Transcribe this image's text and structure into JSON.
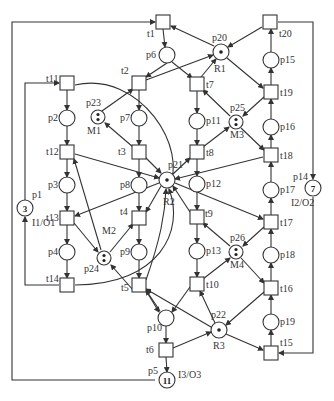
{
  "diagram": {
    "type": "petri-net",
    "colors": {
      "stroke": "#333333",
      "background": "#ffffff"
    },
    "places": [
      {
        "id": "p1",
        "x": 25,
        "y": 208,
        "tokens": "3",
        "label": "p1",
        "sublabel": "I1/O1"
      },
      {
        "id": "p2",
        "x": 67,
        "y": 118,
        "label": "p2"
      },
      {
        "id": "p3",
        "x": 67,
        "y": 185,
        "label": "p3"
      },
      {
        "id": "p4",
        "x": 67,
        "y": 252,
        "label": "p4"
      },
      {
        "id": "p5",
        "x": 167,
        "y": 380,
        "tokens": "11",
        "label": "p5",
        "sublabel": "I3/O3"
      },
      {
        "id": "p6",
        "x": 167,
        "y": 55,
        "label": "p6"
      },
      {
        "id": "p7",
        "x": 139,
        "y": 118,
        "label": "p7"
      },
      {
        "id": "p8",
        "x": 139,
        "y": 185,
        "label": "p8"
      },
      {
        "id": "p9",
        "x": 139,
        "y": 252,
        "label": "p9"
      },
      {
        "id": "p10",
        "x": 166,
        "y": 318,
        "label": "p10"
      },
      {
        "id": "p11",
        "x": 197,
        "y": 121,
        "label": "p11"
      },
      {
        "id": "p12",
        "x": 197,
        "y": 184,
        "label": "p12"
      },
      {
        "id": "p13",
        "x": 197,
        "y": 251,
        "label": "p13"
      },
      {
        "id": "p14",
        "x": 313,
        "y": 188,
        "tokens": "7",
        "label": "p14",
        "sublabel": "I2/O2"
      },
      {
        "id": "p15",
        "x": 271,
        "y": 60,
        "label": "p15"
      },
      {
        "id": "p16",
        "x": 271,
        "y": 127,
        "label": "p16"
      },
      {
        "id": "p17",
        "x": 271,
        "y": 190,
        "label": "p17"
      },
      {
        "id": "p18",
        "x": 271,
        "y": 255,
        "label": "p18"
      },
      {
        "id": "p19",
        "x": 271,
        "y": 322,
        "label": "p19"
      },
      {
        "id": "p20",
        "x": 221,
        "y": 52,
        "tokens": "dot",
        "label": "p20",
        "sublabel": "R1"
      },
      {
        "id": "p21",
        "x": 167,
        "y": 180,
        "tokens": "dot",
        "label": "p21",
        "sublabel": "R2"
      },
      {
        "id": "p22",
        "x": 219,
        "y": 330,
        "tokens": "dot",
        "label": "p22",
        "sublabel": "R3"
      },
      {
        "id": "p23",
        "x": 98,
        "y": 117,
        "tokens": "dots2",
        "label": "p23",
        "sublabel": "M1"
      },
      {
        "id": "p24",
        "x": 104,
        "y": 258,
        "tokens": "dots2",
        "label": "p24",
        "sublabel": "M2"
      },
      {
        "id": "p25",
        "x": 236,
        "y": 122,
        "tokens": "dots2",
        "label": "p25",
        "sublabel": "M3"
      },
      {
        "id": "p26",
        "x": 236,
        "y": 252,
        "tokens": "dots2",
        "label": "p26",
        "sublabel": "M4"
      }
    ],
    "transitions": [
      {
        "id": "t1",
        "x": 163,
        "y": 22,
        "label": "t1"
      },
      {
        "id": "t2",
        "x": 139,
        "y": 83,
        "label": "t2"
      },
      {
        "id": "t3",
        "x": 139,
        "y": 152,
        "label": "t3"
      },
      {
        "id": "t4",
        "x": 139,
        "y": 218,
        "label": "t4"
      },
      {
        "id": "t5",
        "x": 139,
        "y": 285,
        "label": "t5"
      },
      {
        "id": "t6",
        "x": 166,
        "y": 350,
        "label": "t6"
      },
      {
        "id": "t7",
        "x": 197,
        "y": 84,
        "label": "t7"
      },
      {
        "id": "t8",
        "x": 197,
        "y": 152,
        "label": "t8"
      },
      {
        "id": "t9",
        "x": 197,
        "y": 217,
        "label": "t9"
      },
      {
        "id": "t10",
        "x": 197,
        "y": 284,
        "label": "t10"
      },
      {
        "id": "t11",
        "x": 67,
        "y": 83,
        "label": "t11"
      },
      {
        "id": "t12",
        "x": 67,
        "y": 152,
        "label": "t12"
      },
      {
        "id": "t13",
        "x": 67,
        "y": 218,
        "label": "t13"
      },
      {
        "id": "t14",
        "x": 67,
        "y": 285,
        "label": "t14"
      },
      {
        "id": "t15",
        "x": 271,
        "y": 353,
        "label": "t15"
      },
      {
        "id": "t16",
        "x": 271,
        "y": 288,
        "label": "t16"
      },
      {
        "id": "t17",
        "x": 271,
        "y": 222,
        "label": "t17"
      },
      {
        "id": "t18",
        "x": 271,
        "y": 155,
        "label": "t18"
      },
      {
        "id": "t19",
        "x": 271,
        "y": 92,
        "label": "t19"
      },
      {
        "id": "t20",
        "x": 270,
        "y": 22,
        "label": "t20"
      }
    ]
  }
}
